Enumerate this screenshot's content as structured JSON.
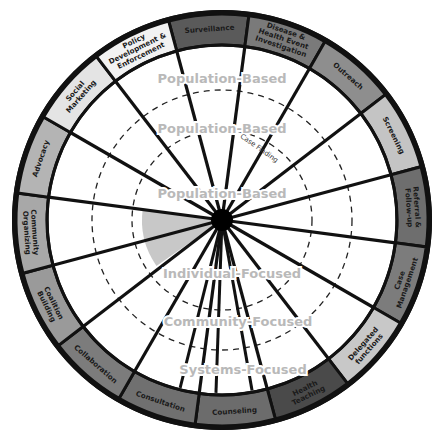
{
  "diagram": {
    "center": [
      222,
      220
    ],
    "outer_radius": 208,
    "inner_radius": 175,
    "start_angle_deg": -105,
    "segments": [
      {
        "label": [
          "Surveillance"
        ],
        "fill": "#5a5a5a"
      },
      {
        "label": [
          "Disease &",
          "Health Event",
          "Investigation"
        ],
        "fill": "#7a7a7a"
      },
      {
        "label": [
          "Outreach"
        ],
        "fill": "#8e8e8e"
      },
      {
        "label": [
          "Screening"
        ],
        "fill": "#c4c4c4"
      },
      {
        "label": [
          "Referral &",
          "Follow-up"
        ],
        "fill": "#6e6e6e"
      },
      {
        "label": [
          "Case",
          "Management"
        ],
        "fill": "#7c7c7c"
      },
      {
        "label": [
          "Delegated",
          "functions"
        ],
        "fill": "#c8c8c8"
      },
      {
        "label": [
          "Health",
          "Teaching"
        ],
        "fill": "#4a4a4a"
      },
      {
        "label": [
          "Counseling"
        ],
        "fill": "#6c6c6c"
      },
      {
        "label": [
          "Consultation"
        ],
        "fill": "#707070"
      },
      {
        "label": [
          "Collaboration"
        ],
        "fill": "#7c7c7c"
      },
      {
        "label": [
          "Coalition",
          "Building"
        ],
        "fill": "#9a9a9a"
      },
      {
        "label": [
          "Community",
          "Organizing"
        ],
        "fill": "#a8a8a8"
      },
      {
        "label": [
          "Advocacy"
        ],
        "fill": "#b4b4b4"
      },
      {
        "label": [
          "Social",
          "Marketing"
        ],
        "fill": "#e4e4e4"
      },
      {
        "label": [
          "Policy",
          "Development &",
          "Enforcement"
        ],
        "fill": "#f2f2f2"
      }
    ],
    "dashed_rings": [
      90,
      130
    ],
    "level_labels": [
      {
        "text": "Population-Based",
        "x": 222,
        "y": 83
      },
      {
        "text": "Population-Based",
        "x": 222,
        "y": 133
      },
      {
        "text": "Population-Based",
        "x": 222,
        "y": 198
      },
      {
        "text": "Individual-Focused",
        "x": 232,
        "y": 278
      },
      {
        "text": "Community-Focused",
        "x": 238,
        "y": 326
      },
      {
        "text": "Systems-Focused",
        "x": 243,
        "y": 374
      }
    ],
    "case_finding_label": "Case Finding",
    "highlight_wedge_fill": "#c8c8c8"
  }
}
